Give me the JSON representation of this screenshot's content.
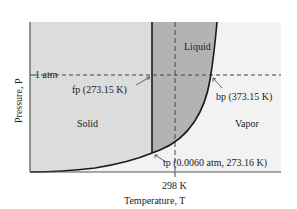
{
  "diagram": {
    "type": "phase-diagram",
    "colors": {
      "solid_region": "#dcdcdc",
      "liquid_region": "#b3b3b3",
      "vapor_region": "#f2f2f2",
      "lines": "#1a1a1a",
      "dashed": "#444444"
    },
    "regions": {
      "solid": "Solid",
      "liquid": "Liquid",
      "vapor": "Vapor"
    },
    "axes": {
      "x_label": "Temperature, T",
      "y_label": "Pressure, P",
      "x_tick": "298 K",
      "y_tick": "1 atm"
    },
    "annotations": {
      "freezing_point": "fp (273.15 K)",
      "boiling_point": "bp (373.15 K)",
      "triple_point": "tp (0.0060 atm, 273.16 K)"
    }
  }
}
